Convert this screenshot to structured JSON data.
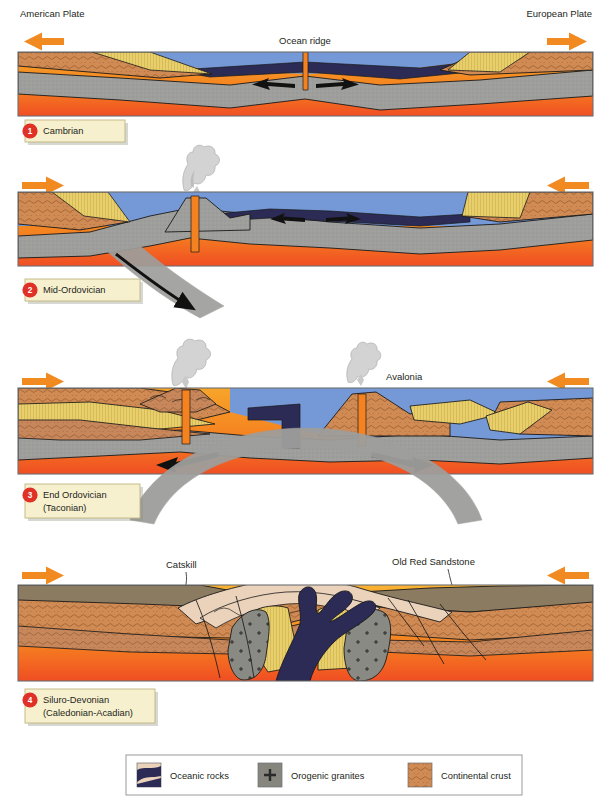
{
  "figure": {
    "title_implicit": "Plate tectonic evolution of the Iapetus Ocean / Caledonian-Acadian orogeny",
    "width": 611,
    "height": 801
  },
  "top_labels": {
    "left_plate": "American Plate",
    "right_plate": "European Plate",
    "left_arrow_icon": "arrow-left-icon",
    "right_arrow_icon": "arrow-right-icon"
  },
  "colors": {
    "arrow_orange": "#F18A21",
    "badge_red": "#E03127",
    "label_box_fill": "#F7F0CE",
    "label_box_border": "#BFB77F",
    "water_blue": "#7499D6",
    "mantle_orange_top": "#F59B23",
    "mantle_orange_bottom": "#F15A24",
    "lithosphere_gray": "#9E9E9C",
    "oceanic_navy": "#2B2B55",
    "continental_crust": "#D08A53",
    "sediment_yellow": "#E3C559",
    "sediment_tan": "#C79A62",
    "molasse_pink": "#EBD2BB",
    "granite_gray": "#86867F",
    "old_red_brown": "#8B7B60",
    "panel_border": "#6D6E71"
  },
  "panels": [
    {
      "number": "1",
      "stage": "Cambrian",
      "stage_line2": "",
      "arrows": {
        "left": "left",
        "right": "right"
      },
      "features": [
        {
          "name": "Ocean ridge",
          "label": "Ocean ridge"
        }
      ],
      "internal_arrows": [
        "left",
        "right"
      ]
    },
    {
      "number": "2",
      "stage": "Mid-Ordovician",
      "stage_line2": "",
      "arrows": {
        "left": "right",
        "right": "left"
      },
      "features": [
        {
          "name": "volcano",
          "label": ""
        }
      ],
      "internal_arrows": [
        "left",
        "right",
        "subduction-down"
      ]
    },
    {
      "number": "3",
      "stage": "End Ordovician",
      "stage_line2": "(Taconian)",
      "arrows": {
        "left": "right",
        "right": "left"
      },
      "features": [
        {
          "name": "Avalonia",
          "label": "Avalonia"
        }
      ],
      "internal_arrows": [
        "left",
        "right"
      ]
    },
    {
      "number": "4",
      "stage": "Siluro-Devonian",
      "stage_line2": "(Caledonian-Acadian)",
      "arrows": {
        "left": "right",
        "right": "left"
      },
      "features": [
        {
          "name": "Catskill",
          "label": "Catskill"
        },
        {
          "name": "Old Red Sandstone",
          "label": "Old Red Sandstone"
        }
      ],
      "internal_arrows": []
    }
  ],
  "legend": {
    "items": [
      {
        "swatch": "oceanic-rocks-swatch",
        "label": "Oceanic rocks"
      },
      {
        "swatch": "orogenic-granites-swatch",
        "label": "Orogenic granites"
      },
      {
        "swatch": "continental-crust-swatch",
        "label": "Continental crust"
      }
    ]
  }
}
